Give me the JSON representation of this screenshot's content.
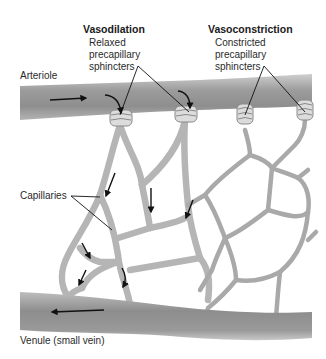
{
  "figure": {
    "labels": {
      "vasodilation_title": "Vasodilation",
      "vasodilation_line1": "Relaxed",
      "vasodilation_line2": "precapillary",
      "vasodilation_line3": "sphincters",
      "vasoconstriction_title": "Vasoconstriction",
      "vasoconstriction_line1": "Constricted",
      "vasoconstriction_line2": "precapillary",
      "vasoconstriction_line3": "sphincters",
      "arteriole": "Arteriole",
      "capillaries": "Capillaries",
      "venule": "Venule (small vein)"
    },
    "caption": "",
    "colors": {
      "vessel_fill": "#9a9a9a",
      "vessel_edge": "#c8c8c8",
      "capillary": "#a6a6a6",
      "arrow": "#111111",
      "background": "#ffffff"
    }
  }
}
